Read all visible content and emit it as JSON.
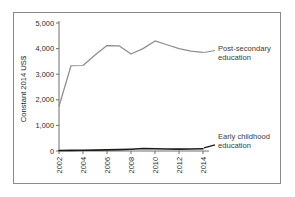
{
  "chart_data": {
    "type": "line",
    "title": "",
    "xlabel": "",
    "ylabel": "Constant 2014 US$",
    "grid": false,
    "legend_position": "right-inline-labels",
    "x": [
      2002,
      2003,
      2004,
      2005,
      2006,
      2007,
      2008,
      2009,
      2010,
      2011,
      2012,
      2013,
      2014
    ],
    "xlim": [
      2002,
      2014
    ],
    "ylim": [
      0,
      5000
    ],
    "x_tick_labels": [
      "2002",
      "2004",
      "2006",
      "2008",
      "2010",
      "2012",
      "2014"
    ],
    "x_tick_values": [
      2002,
      2004,
      2006,
      2008,
      2010,
      2012,
      2014
    ],
    "x_tick_rotation_deg": 90,
    "y_tick_labels": [
      "5,000",
      "4,000",
      "3,000",
      "2,000",
      "1,000",
      "0"
    ],
    "y_tick_values": [
      5000,
      4000,
      3000,
      2000,
      1000,
      0
    ],
    "series": [
      {
        "name": "Post-secondary education",
        "label_line1": "Post-secondary",
        "label_line2": "education",
        "color": "#8e8e8e",
        "values": [
          1750,
          3330,
          3340,
          3750,
          4120,
          4110,
          3790,
          4000,
          4300,
          4150,
          4000,
          3900,
          3850
        ]
      },
      {
        "name": "Early childhood education",
        "label_line1": "Early childhood",
        "label_line2": "education",
        "color": "#1a1a1a",
        "values": [
          20,
          25,
          30,
          35,
          45,
          55,
          70,
          95,
          90,
          80,
          75,
          80,
          85
        ]
      }
    ]
  },
  "figure": {
    "border_color": "#8a8a8a",
    "background": "#ffffff"
  }
}
